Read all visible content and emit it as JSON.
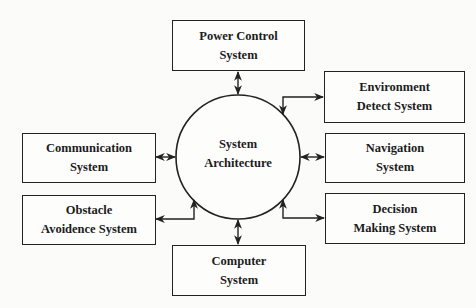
{
  "diagram": {
    "center": {
      "line1": "System",
      "line2": "Architecture",
      "shape": "circle"
    },
    "nodes": {
      "power_control": {
        "line1": "Power Control",
        "line2": "System"
      },
      "environment_detect": {
        "line1": "Environment",
        "line2": "Detect System"
      },
      "communication": {
        "line1": "Communication",
        "line2": "System"
      },
      "navigation": {
        "line1": "Navigation",
        "line2": "System"
      },
      "obstacle_avoidence": {
        "line1": "Obstacle",
        "line2": "Avoidence System"
      },
      "decision_making": {
        "line1": "Decision",
        "line2": "Making System"
      },
      "computer": {
        "line1": "Computer",
        "line2": "System"
      }
    },
    "edges": [
      {
        "from": "system_architecture",
        "to": "power_control",
        "direction": "bidirectional"
      },
      {
        "from": "system_architecture",
        "to": "environment_detect",
        "direction": "bidirectional"
      },
      {
        "from": "system_architecture",
        "to": "communication",
        "direction": "bidirectional"
      },
      {
        "from": "system_architecture",
        "to": "navigation",
        "direction": "bidirectional"
      },
      {
        "from": "system_architecture",
        "to": "obstacle_avoidence",
        "direction": "bidirectional"
      },
      {
        "from": "system_architecture",
        "to": "decision_making",
        "direction": "bidirectional"
      },
      {
        "from": "system_architecture",
        "to": "computer",
        "direction": "bidirectional"
      }
    ],
    "colors": {
      "line": "#222222",
      "background": "#fbfbfa"
    }
  }
}
